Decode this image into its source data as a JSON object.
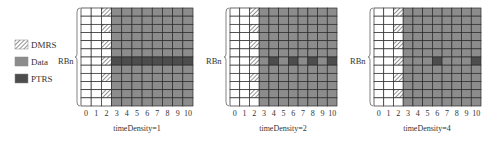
{
  "legend": [
    {
      "key": "dmrs",
      "label": "DMRS"
    },
    {
      "key": "data",
      "label": "Data"
    },
    {
      "key": "ptrs",
      "label": "PTRS"
    }
  ],
  "colors": {
    "data": "#8c8c8c",
    "ptrs": "#4d4d4d",
    "dmrs_bg": "#ffffff",
    "dmrs_hatch": "#777777",
    "empty": "#ffffff",
    "grid_line": "#2a2a2a"
  },
  "grid": {
    "rows": 12,
    "columns": 11,
    "symbol_labels": [
      "0",
      "1",
      "2",
      "3",
      "4",
      "5",
      "6",
      "7",
      "8",
      "9",
      "10"
    ],
    "empty_columns": [
      0,
      1
    ],
    "dmrs_column": 2,
    "dmrs_rows_from_top": [
      0,
      2,
      4,
      6,
      8,
      10
    ],
    "data_start_column": 3,
    "ptrs_row_from_top": 6
  },
  "panels": [
    {
      "rb_label": "RBn",
      "caption": "timeDensity=1",
      "time_density": 1,
      "ptrs_columns": [
        3,
        4,
        5,
        6,
        7,
        8,
        9,
        10
      ]
    },
    {
      "rb_label": "RBn",
      "caption": "timeDensity=2",
      "time_density": 2,
      "ptrs_columns": [
        4,
        6,
        8,
        10
      ]
    },
    {
      "rb_label": "RBn",
      "caption": "timeDensity=4",
      "time_density": 4,
      "ptrs_columns": [
        6,
        10
      ]
    }
  ]
}
